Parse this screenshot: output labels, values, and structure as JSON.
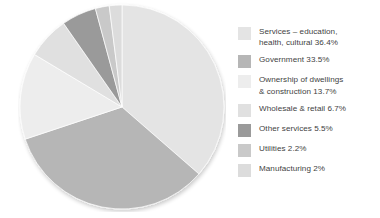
{
  "chart_data": {
    "type": "pie",
    "title": "",
    "subtitle": "",
    "xlabel": "",
    "ylabel": "",
    "legend_position": "right",
    "grid": false,
    "unit": "%",
    "total": 100,
    "categories": [
      "Services – education, health, cultural",
      "Government",
      "Ownership of dwellings & construction",
      "Wholesale & retail",
      "Other services",
      "Utilities",
      "Manufacturing"
    ],
    "values": [
      36.4,
      33.5,
      13.7,
      6.7,
      5.5,
      2.2,
      2.0
    ],
    "colors": [
      "#e4e4e4",
      "#b6b6b6",
      "#ededed",
      "#e0e0e0",
      "#9a9a9a",
      "#c9c9c9",
      "#dcdcdc"
    ],
    "slices": [
      {
        "label": "Services – education, health, cultural",
        "value": 36.4,
        "color": "#e4e4e4"
      },
      {
        "label": "Government",
        "value": 33.5,
        "color": "#b6b6b6"
      },
      {
        "label": "Ownership of dwellings & construction",
        "value": 13.7,
        "color": "#ededed"
      },
      {
        "label": "Wholesale & retail",
        "value": 6.7,
        "color": "#e0e0e0"
      },
      {
        "label": "Other services",
        "value": 5.5,
        "color": "#9a9a9a"
      },
      {
        "label": "Utilities",
        "value": 2.2,
        "color": "#c9c9c9"
      },
      {
        "label": "Manufacturing",
        "value": 2.0,
        "color": "#dcdcdc"
      }
    ]
  },
  "legend": {
    "items": [
      {
        "text": "Services – education,\nhealth, cultural 36.4%",
        "swatch": "#e4e4e4",
        "name": "legend-item-services"
      },
      {
        "text": "Government 33.5%",
        "swatch": "#b6b6b6",
        "name": "legend-item-government"
      },
      {
        "text": "Ownership of dwellings\n& construction 13.7%",
        "swatch": "#ededed",
        "name": "legend-item-ownership-dwellings"
      },
      {
        "text": "Wholesale & retail 6.7%",
        "swatch": "#e0e0e0",
        "name": "legend-item-wholesale-retail"
      },
      {
        "text": "Other services 5.5%",
        "swatch": "#9a9a9a",
        "name": "legend-item-other-services"
      },
      {
        "text": "Utilities 2.2%",
        "swatch": "#c9c9c9",
        "name": "legend-item-utilities"
      },
      {
        "text": "Manufacturing 2%",
        "swatch": "#dcdcdc",
        "name": "legend-item-manufacturing"
      }
    ]
  }
}
